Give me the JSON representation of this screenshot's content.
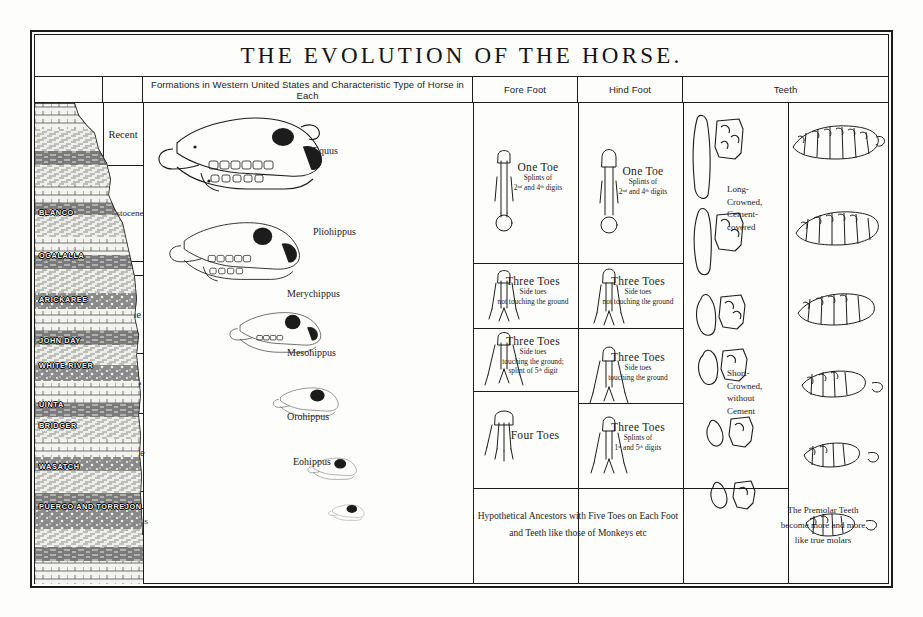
{
  "title": "THE EVOLUTION OF THE HORSE.",
  "headers": [
    {
      "key": "era",
      "label": ""
    },
    {
      "key": "epoch",
      "label": ""
    },
    {
      "key": "formations",
      "label": "Formations in Western United States and Characteristic Type of Horse in Each"
    },
    {
      "key": "fore_foot",
      "label": "Fore Foot"
    },
    {
      "key": "hind_foot",
      "label": "Hind Foot"
    },
    {
      "key": "teeth",
      "label": "Teeth"
    }
  ],
  "eras": [
    {
      "name": "Quaternary\nor\nAge of Man",
      "line1": "Quaternary",
      "line2": "or",
      "line3": "Age of Man"
    },
    {
      "name": "Tertiary or Age of Mammals",
      "line1": "Tertiary",
      "line2": "or",
      "line3": "Age of",
      "line4": "Mammals"
    },
    {
      "name": "Age of Reptiles",
      "line1": "Age of",
      "line2": "Reptiles"
    }
  ],
  "epochs": [
    {
      "label": "Recent"
    },
    {
      "label": "Pleistocene"
    },
    {
      "label": "Pliocene"
    },
    {
      "label": "Miocene"
    },
    {
      "label": "Oligocene"
    },
    {
      "label": "Eocene"
    },
    {
      "label": "Paleocene"
    },
    {
      "label": "Cretaceous"
    },
    {
      "label": "Jurassic"
    },
    {
      "label": "Triassic"
    }
  ],
  "formations": [
    {
      "name": "BLANCO"
    },
    {
      "name": "OGALALLA"
    },
    {
      "name": "ARICKAREE"
    },
    {
      "name": "JOHN DAY"
    },
    {
      "name": "WHITE RIVER"
    },
    {
      "name": "UINTA"
    },
    {
      "name": "BRIDGER"
    },
    {
      "name": "WASATCH"
    },
    {
      "name": "PUERCO AND TORREJON"
    }
  ],
  "genera": [
    {
      "name": "Equus"
    },
    {
      "name": "Pliohippus"
    },
    {
      "name": "Merychippus"
    },
    {
      "name": "Mesohippus"
    },
    {
      "name": "Orohippus"
    },
    {
      "name": "Eohippus"
    }
  ],
  "fore_foot": [
    {
      "big": "One Toe",
      "small": "Splints of\n2ⁿᵈ and 4ᵗʰ digits",
      "small1": "Splints of",
      "small2": "2ⁿᵈ and 4ᵗʰ digits"
    },
    {
      "big": "Three Toes",
      "small1": "Side toes",
      "small2": "not touching the ground",
      "small3": ""
    },
    {
      "big": "Three Toes",
      "small1": "Side toes",
      "small2": "touching the ground;",
      "small3": "splint of 5ᵗʰ digit"
    },
    {
      "big": "Four Toes",
      "small1": "",
      "small2": "",
      "small3": ""
    }
  ],
  "hind_foot": [
    {
      "big": "One Toe",
      "small1": "Splints of",
      "small2": "2ⁿᵈ and 4ᵗʰ digits",
      "small3": ""
    },
    {
      "big": "Three Toes",
      "small1": "Side toes",
      "small2": "not touching the ground",
      "small3": ""
    },
    {
      "big": "Three Toes",
      "small1": "Side toes",
      "small2": "touching the ground",
      "small3": ""
    },
    {
      "big": "Three Toes",
      "small1": "Splints of",
      "small2": "1ˢᵗ and 5ᵗʰ digits",
      "small3": ""
    }
  ],
  "teeth_notes": [
    {
      "line1": "Long-",
      "line2": "Crowned,",
      "line3": "Cement-",
      "line4": "covered"
    },
    {
      "line1": "Short-",
      "line2": "Crowned,",
      "line3": "without",
      "line4": "Cement"
    }
  ],
  "bottom_caption": {
    "line1": "Hypothetical Ancestors with Five Toes on Each Foot",
    "line2": "and Teeth like those of Monkeys etc"
  },
  "teeth_caption": {
    "line1": "The Premolar Teeth",
    "line2": "become more and more",
    "line3": "like true molars"
  },
  "signature": "",
  "colors": {
    "ink": "#1c1c1c",
    "paper": "#fdfdfb",
    "dark_band": "#6e6e6e",
    "light_band": "#efefec"
  }
}
